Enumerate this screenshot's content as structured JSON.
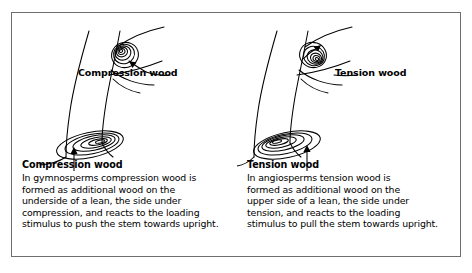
{
  "figure": {
    "title_present": false,
    "panels": [
      {
        "id": "compression-wood",
        "inline_label": "Compression wood",
        "caption_title": "Compression wood",
        "caption_lines": [
          "In gymnosperms compression wood is",
          "formed as additional wood on the",
          "underside of a lean, the side under",
          "compression, and reacts to the loading",
          "stimulus to push the stem towards upright."
        ],
        "caption_text": "In gymnosperms compression wood is formed as additional wood on the underside of a lean, the side under compression, and reacts to the loading stimulus to push the stem towards upright.",
        "branch_arrow_direction": "down-left",
        "stem_arrow_direction": "up",
        "ring_eccentricity_side": "lower-right"
      },
      {
        "id": "tension-wood",
        "inline_label": "Tension wood",
        "caption_title": "Tension wood",
        "caption_lines": [
          "In angiosperms tension wood is",
          "formed as additional wood on the",
          "upper side of a lean, the side under",
          "tension, and reacts to the loading",
          "stimulus to pull the stem towards upright."
        ],
        "caption_text": "In angiosperms tension wood is formed as additional wood on the upper side of a lean, the side under tension, and reacts to the loading stimulus to pull the stem towards upright.",
        "branch_arrow_direction": "up-right",
        "stem_arrow_direction": "up",
        "ring_eccentricity_side": "lower-left"
      }
    ]
  },
  "colors": {
    "background": "#ffffff",
    "border": "#6e6e6e",
    "ink": "#000000"
  },
  "icons": {
    "branch_section": "growth-ring-section-icon",
    "stem_section": "growth-ring-section-icon",
    "arrow": "arrow-icon"
  }
}
